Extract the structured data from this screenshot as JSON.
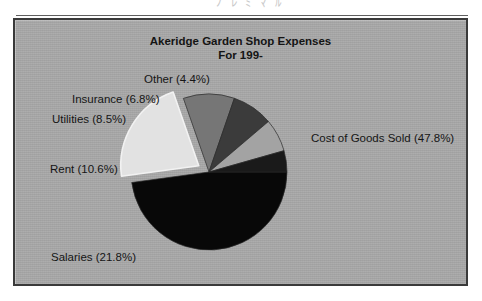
{
  "page": {
    "scan_top_text": "ﾠ ﾉ ﾚ ﾐ ﾏ ﾙ",
    "background_color": "#ffffff"
  },
  "figure": {
    "frame_border_color": "#3a3a3a",
    "panel_color": "#a9a9a9"
  },
  "chart_data": {
    "type": "pie",
    "title": "Akeridge Garden Shop Expenses",
    "subtitle": "For 199-",
    "xlabel": "",
    "ylabel": "",
    "grid": false,
    "legend": "none",
    "label_format": "{name} ({value}%)",
    "exploded_slice": "Salaries",
    "start_angle_deg": 0,
    "direction": "clockwise",
    "categories": [
      "Cost of Goods Sold",
      "Salaries",
      "Rent",
      "Utilities",
      "Insurance",
      "Other"
    ],
    "values": [
      47.8,
      21.8,
      10.6,
      8.5,
      6.8,
      4.4
    ],
    "colors": [
      "#080808",
      "#e2e2e2",
      "#767676",
      "#3b3b3b",
      "#a3a3a3",
      "#1a1a1a"
    ],
    "slices": [
      {
        "name": "Cost of Goods Sold",
        "value": 47.8,
        "label": "Cost of Goods Sold (47.8%)",
        "color": "#080808",
        "exploded": false
      },
      {
        "name": "Salaries",
        "value": 21.8,
        "label": "Salaries (21.8%)",
        "color": "#e2e2e2",
        "exploded": true
      },
      {
        "name": "Rent",
        "value": 10.6,
        "label": "Rent (10.6%)",
        "color": "#767676",
        "exploded": false
      },
      {
        "name": "Utilities",
        "value": 8.5,
        "label": "Utilities (8.5%)",
        "color": "#3b3b3b",
        "exploded": false
      },
      {
        "name": "Insurance",
        "value": 6.8,
        "label": "Insurance (6.8%)",
        "color": "#a3a3a3",
        "exploded": false
      },
      {
        "name": "Other",
        "value": 4.4,
        "label": "Other (4.4%)",
        "color": "#1a1a1a",
        "exploded": false
      }
    ]
  }
}
